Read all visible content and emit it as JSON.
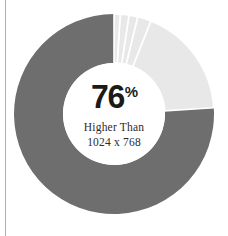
{
  "chart_data": {
    "type": "pie",
    "title": "",
    "subtitle": "",
    "xlabel": "",
    "ylabel": "",
    "legend_position": "none",
    "grid": false,
    "donut": true,
    "inner_radius_ratio": 0.51,
    "start_angle_deg": 0,
    "direction": "counterclockwise",
    "categories": [
      "Higher Than 1024 x 768",
      "Other resolution A",
      "Other resolution B",
      "Other resolution C",
      "Other resolution D",
      "Other resolution E"
    ],
    "values": [
      76,
      18,
      2.2,
      1.4,
      1.4,
      1.0
    ],
    "units": "%",
    "colors": [
      "#6e6e6e",
      "#e8e8e8",
      "#e8e8e8",
      "#e8e8e8",
      "#e8e8e8",
      "#e8e8e8"
    ],
    "slice_separator_color": "#ffffff",
    "highlight_value": 76,
    "highlight_label": "Higher Than 1024 x 768"
  },
  "center": {
    "value": "76",
    "percent_sign": "%",
    "caption_line_1": "Higher Than",
    "caption_line_2": "1024 x 768"
  },
  "colors": {
    "primary_slice": "#6e6e6e",
    "secondary_slice": "#e8e8e8",
    "background": "#ffffff",
    "text": "#1a1a1a",
    "caption_text": "#2b2b2b",
    "rule": "#b0b0b0"
  }
}
